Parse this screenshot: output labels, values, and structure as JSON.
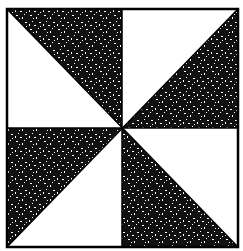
{
  "diagram": {
    "type": "quilt-block",
    "name": "Pinwheel",
    "colors": {
      "background": "#ffffff",
      "dark_fill": "#111111",
      "speckle": "#ffffff",
      "outline": "#000000"
    },
    "grid": {
      "rows": 2,
      "cols": 2
    },
    "pieces": [
      {
        "quadrant": "top-left",
        "dark": "upper-right triangle",
        "light": "lower-left triangle"
      },
      {
        "quadrant": "top-right",
        "dark": "lower-right triangle",
        "light": "upper-left triangle"
      },
      {
        "quadrant": "bottom-left",
        "dark": "upper-left triangle",
        "light": "lower-right triangle"
      },
      {
        "quadrant": "bottom-right",
        "dark": "lower-left triangle",
        "light": "upper-right triangle"
      }
    ]
  }
}
